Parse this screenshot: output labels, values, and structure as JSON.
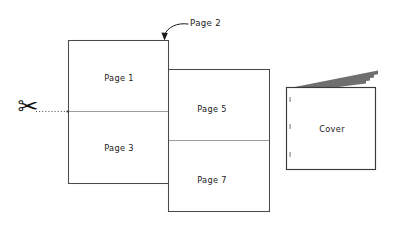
{
  "diagram": {
    "background_color": "#ffffff",
    "line_color": "#4a4a4a",
    "fold_line_color": "#8d8d8d",
    "text_color": "#1b1b1b",
    "sheets": [
      {
        "id": "sheet-front",
        "panels": [
          {
            "id": "panel-page-1",
            "label": "Page 1"
          },
          {
            "id": "panel-page-3",
            "label": "Page 3"
          }
        ]
      },
      {
        "id": "sheet-back",
        "panels": [
          {
            "id": "panel-page-5",
            "label": "Page 5"
          },
          {
            "id": "panel-page-7",
            "label": "Page 7"
          }
        ]
      }
    ],
    "callout": {
      "id": "callout-page-2",
      "label": "Page 2",
      "points_to": "sheet-front-top-right-corner"
    },
    "cut": {
      "id": "cut-guide",
      "icon": "scissors-icon",
      "glyph": "✂",
      "line_style": "dotted"
    },
    "booklet": {
      "id": "finished-booklet",
      "label": "Cover",
      "leaf_count": 4
    }
  }
}
